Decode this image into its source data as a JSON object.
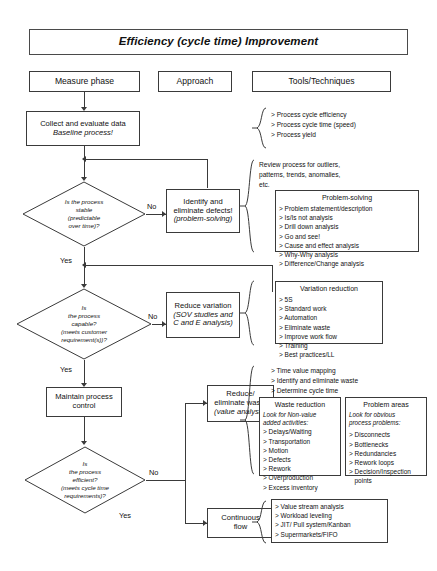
{
  "title": "Efficiency (cycle time) Improvement",
  "columns": {
    "measure": "Measure phase",
    "approach": "Approach",
    "tools": "Tools/Techniques"
  },
  "nodes": {
    "collect": {
      "line1": "Collect and evaluate data",
      "line2": "Baseline process!"
    },
    "d_stable": {
      "l1": "Is the process",
      "l2": "stable",
      "l3": "(predictable",
      "l4": "over time)?"
    },
    "identify": {
      "l1": "Identify and",
      "l2": "eliminate defects!",
      "l3": "(problem-solving)"
    },
    "d_capable": {
      "l1": "Is",
      "l2": "the process",
      "l3": "capable?",
      "l4": "(meets customer",
      "l5": "requirement(s))?"
    },
    "reduce_var": {
      "l1": "Reduce variation",
      "l2": "(SOV studies and",
      "l3": "C and E analysis)"
    },
    "maintain": {
      "l1": "Maintain process",
      "l2": "control"
    },
    "d_efficient": {
      "l1": "Is",
      "l2": "the process",
      "l3": "efficient?",
      "l4": "(meets cycle time",
      "l5": "requirements)?"
    },
    "reduce_waste": {
      "l1": "Reduce/",
      "l2": "eliminate waste",
      "l3": "(value analysis)"
    },
    "continuous": {
      "l1": "Continuous",
      "l2": "flow"
    }
  },
  "edge_labels": {
    "no_stable": "No",
    "yes_stable": "Yes",
    "no_capable": "No",
    "yes_capable": "Yes",
    "no_efficient": "No",
    "yes_efficient": "Yes"
  },
  "tools": {
    "baseline_metrics": [
      "> Process cycle efficiency",
      "> Process cycle time (speed)",
      "> Process yield"
    ],
    "review_note": [
      "Review process for outliers,",
      "patterns, trends, anomalies,",
      "etc."
    ],
    "problem_solving": {
      "title": "Problem-solving",
      "items": [
        "> Problem statement/description",
        "> Is/Is not analysis",
        "> Drill down analysis",
        "> Go and see!",
        "> Cause and effect analysis",
        "> Why-Why analysis",
        "> Difference/Change analysis"
      ]
    },
    "variation_reduction": {
      "title": "Variation reduction",
      "items": [
        "> 5S",
        "> Standard work",
        "> Automation",
        "> Eliminate waste",
        "> Improve work flow",
        "> Training",
        "> Best practices/LL"
      ]
    },
    "cycle_time_note": [
      "> Time value mapping",
      "> Identify and eliminate waste",
      "> Determine cycle time"
    ],
    "waste_reduction": {
      "title": "Waste reduction",
      "subtitle": [
        "Look for Non-value",
        "added activities:"
      ],
      "items": [
        "> Delays/Waiting",
        "> Transportation",
        "> Motion",
        "> Defects",
        "> Rework",
        "> Overproduction",
        "> Excess inventory"
      ]
    },
    "problem_areas": {
      "title": "Problem areas",
      "subtitle": [
        "Look for obvious",
        "process problems:"
      ],
      "items": [
        "> Disconnects",
        "> Bottlenecks",
        "> Redundancies",
        "> Rework loops",
        "> Decision/Inspection",
        "points"
      ]
    },
    "continuous_flow_tools": [
      "> Value stream analysis",
      "> Workload leveling",
      "> JIT/ Pull system/Kanban",
      "> Supermarkets/FIFO"
    ]
  },
  "colors": {
    "stroke": "#3a3a3a",
    "text": "#111111",
    "background": "#ffffff"
  }
}
